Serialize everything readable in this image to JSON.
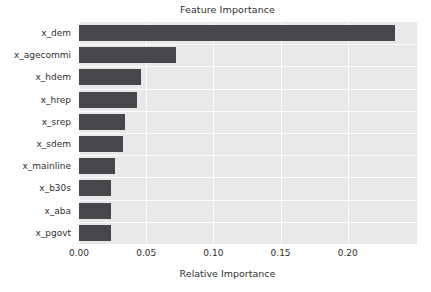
{
  "chart_data": {
    "type": "bar",
    "orientation": "horizontal",
    "title": "Feature Importance",
    "xlabel": "Relative Importance",
    "ylabel": "",
    "categories": [
      "x_dem",
      "x_agecommi",
      "x_hdem",
      "x_hrep",
      "x_srep",
      "x_sdem",
      "x_mainline",
      "x_b30s",
      "x_aba",
      "x_pgovt"
    ],
    "values": [
      0.235,
      0.072,
      0.046,
      0.043,
      0.034,
      0.033,
      0.027,
      0.024,
      0.024,
      0.024
    ],
    "xlim": [
      0.0,
      0.2515
    ],
    "xticks": [
      0.0,
      0.05,
      0.1,
      0.15,
      0.2
    ],
    "xticklabels": [
      "0.00",
      "0.05",
      "0.10",
      "0.15",
      "0.20"
    ],
    "grid": true,
    "legend": null,
    "bar_color": "#46464b",
    "plot_background": "#e9e9e9",
    "gridline_color": "#fcfcfc",
    "figure_background": "#ffffff"
  }
}
